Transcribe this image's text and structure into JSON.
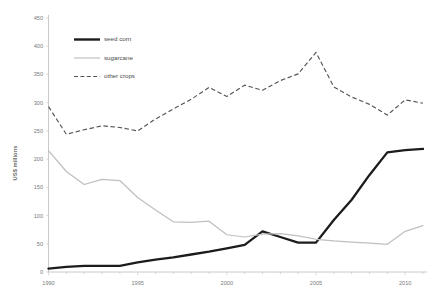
{
  "chart_data": {
    "type": "line",
    "title": "",
    "subtitle": "",
    "xlabel": "",
    "ylabel": "US$ millions",
    "xlim": [
      1990,
      2011
    ],
    "ylim": [
      0,
      450
    ],
    "ytick_step": 50,
    "yticks": [
      0,
      50,
      100,
      150,
      200,
      250,
      300,
      350,
      400,
      450
    ],
    "ytick_labels": [
      "0",
      "50",
      "100",
      "150",
      "200",
      "250",
      "300",
      "350",
      "400",
      "450"
    ],
    "xticks": [
      1990,
      1995,
      2000,
      2005,
      2010
    ],
    "xtick_labels": [
      "1990",
      "1995",
      "2000",
      "2005",
      "2010"
    ],
    "x_minor_ticks": [
      1991,
      1992,
      1993,
      1994,
      1996,
      1997,
      1998,
      1999,
      2001,
      2002,
      2003,
      2004,
      2006,
      2007,
      2008,
      2009,
      2011
    ],
    "grid": false,
    "legend_position": "upper-left-inside",
    "x": [
      1990,
      1991,
      1992,
      1993,
      1994,
      1995,
      1996,
      1997,
      1998,
      1999,
      2000,
      2001,
      2002,
      2003,
      2004,
      2005,
      2006,
      2007,
      2008,
      2009,
      2010,
      2011
    ],
    "series": [
      {
        "name": "seed corn",
        "style": "solid-thick",
        "color": "#1c1c1c",
        "values": [
          6,
          9,
          11,
          11,
          11,
          17,
          22,
          26,
          31,
          36,
          42,
          48,
          72,
          62,
          52,
          52,
          92,
          128,
          172,
          212,
          216,
          218
        ]
      },
      {
        "name": "sugarcane",
        "style": "solid-thin",
        "color": "#bfbfbf",
        "values": [
          215,
          178,
          155,
          164,
          162,
          132,
          110,
          89,
          88,
          90,
          66,
          62,
          67,
          68,
          64,
          58,
          55,
          53,
          51,
          49,
          72,
          82
        ]
      },
      {
        "name": "other crops",
        "style": "dashed",
        "color": "#555555",
        "values": [
          293,
          244,
          252,
          259,
          256,
          250,
          271,
          289,
          306,
          327,
          311,
          331,
          322,
          339,
          351,
          389,
          328,
          310,
          297,
          278,
          305,
          299
        ]
      }
    ]
  },
  "legend": {
    "items": [
      {
        "label": "seed corn",
        "swatch": "solid-thick-line"
      },
      {
        "label": "sugarcane",
        "swatch": "solid-thin-line"
      },
      {
        "label": "other crops",
        "swatch": "dashed-line"
      }
    ]
  }
}
